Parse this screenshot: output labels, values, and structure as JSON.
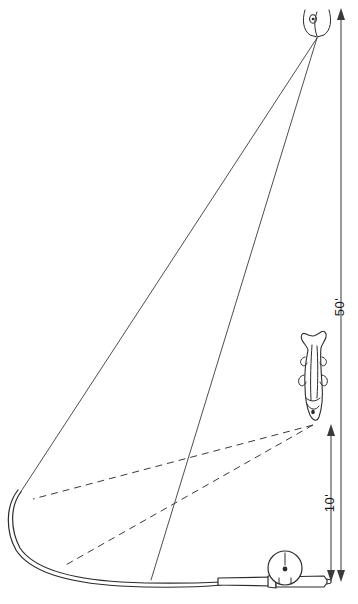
{
  "diagram": {
    "background_color": "#ffffff",
    "ink_color": "#2b2b2b",
    "width": 358,
    "height": 604
  },
  "dimensions": [
    {
      "id": "fifty-feet",
      "label": "50'",
      "value": 50,
      "unit": "feet",
      "orientation": "vertical",
      "x": 341,
      "y_top": 10,
      "y_bottom": 580,
      "label_y": 307,
      "arrow_top": true,
      "arrow_bottom": true
    },
    {
      "id": "ten-feet",
      "label": "10'",
      "value": 10,
      "unit": "feet",
      "orientation": "vertical",
      "x": 331,
      "y_top": 426,
      "y_bottom": 580,
      "label_y": 503,
      "arrow_top": true,
      "arrow_bottom": true
    }
  ],
  "elements": {
    "rod_tip_top": {
      "name": "rod-tip-guide",
      "x": 317,
      "y": 37
    },
    "fish": {
      "name": "hooked-fish",
      "x": 313,
      "y": 375,
      "orientation": "head-down",
      "view": "dorsal"
    },
    "reel": {
      "name": "spinning-reel",
      "x": 285,
      "y": 568,
      "radius": 17
    },
    "rod_handle": {
      "name": "rod-butt-handle",
      "x_left": 218,
      "x_right": 330,
      "y": 583
    },
    "rod_curve_tip": {
      "name": "bent-rod-tip",
      "x": 18,
      "y": 490
    }
  },
  "lines": {
    "taut_line_long": {
      "name": "line-from-tip-to-rod-tip",
      "style": "solid"
    },
    "taut_line_short": {
      "name": "line-from-tip-to-reel",
      "style": "solid"
    },
    "slack_line_upper": {
      "name": "dashed-line-upper",
      "style": "dashed"
    },
    "slack_line_lower": {
      "name": "dashed-line-lower",
      "style": "dashed"
    }
  }
}
